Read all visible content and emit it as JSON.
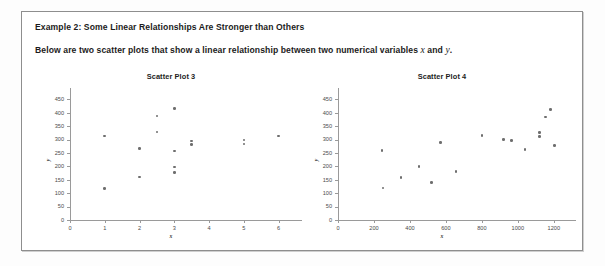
{
  "document": {
    "heading": "Example 2:  Some Linear Relationships Are Stronger than Others",
    "subheading_before": "Below are two scatter plots that show a linear relationship between two numerical variables ",
    "subheading_var_x": "x",
    "subheading_mid": " and ",
    "subheading_var_y": "y",
    "subheading_after": ".",
    "border_color": "#8e8e8e",
    "background_color": "#ffffff"
  },
  "chart_data": [
    {
      "type": "scatter",
      "title": "Scatter Plot 3",
      "xlabel": "x",
      "ylabel": "y",
      "xlim": [
        0,
        6.5
      ],
      "ylim": [
        0,
        470
      ],
      "xticks": [
        0,
        1,
        2,
        3,
        4,
        5,
        6
      ],
      "yticks": [
        0,
        50,
        100,
        150,
        200,
        250,
        300,
        350,
        400,
        450
      ],
      "grid": false,
      "legend": "none",
      "marker_color": "#6e6e6e",
      "relationship": "weak",
      "points": [
        {
          "x": 1,
          "y": 313
        },
        {
          "x": 1,
          "y": 118
        },
        {
          "x": 2,
          "y": 266
        },
        {
          "x": 2,
          "y": 160
        },
        {
          "x": 2.5,
          "y": 388
        },
        {
          "x": 2.5,
          "y": 328
        },
        {
          "x": 3,
          "y": 416
        },
        {
          "x": 3,
          "y": 257
        },
        {
          "x": 3,
          "y": 197
        },
        {
          "x": 3,
          "y": 178
        },
        {
          "x": 3.5,
          "y": 294
        },
        {
          "x": 3.5,
          "y": 281
        },
        {
          "x": 5,
          "y": 299
        },
        {
          "x": 5,
          "y": 284
        },
        {
          "x": 6,
          "y": 314
        }
      ]
    },
    {
      "type": "scatter",
      "title": "Scatter Plot 4",
      "xlabel": "x",
      "ylabel": "y",
      "xlim": [
        0,
        1290
      ],
      "ylim": [
        0,
        470
      ],
      "xticks": [
        0,
        200,
        400,
        600,
        800,
        1000,
        1200
      ],
      "yticks": [
        0,
        50,
        100,
        150,
        200,
        250,
        300,
        350,
        400,
        450
      ],
      "grid": false,
      "legend": "none",
      "marker_color": "#6e6e6e",
      "relationship": "strong positive",
      "points": [
        {
          "x": 245,
          "y": 260
        },
        {
          "x": 250,
          "y": 120
        },
        {
          "x": 350,
          "y": 159
        },
        {
          "x": 450,
          "y": 199
        },
        {
          "x": 520,
          "y": 140
        },
        {
          "x": 570,
          "y": 288
        },
        {
          "x": 655,
          "y": 180
        },
        {
          "x": 800,
          "y": 315
        },
        {
          "x": 920,
          "y": 300
        },
        {
          "x": 965,
          "y": 296
        },
        {
          "x": 1040,
          "y": 264
        },
        {
          "x": 1120,
          "y": 326
        },
        {
          "x": 1120,
          "y": 311
        },
        {
          "x": 1155,
          "y": 384
        },
        {
          "x": 1180,
          "y": 413
        },
        {
          "x": 1205,
          "y": 279
        }
      ]
    }
  ]
}
